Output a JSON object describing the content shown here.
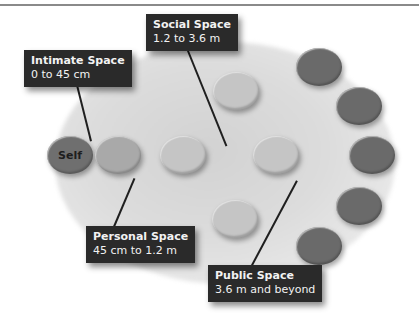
{
  "diagram": {
    "center_label": "Self",
    "zones": [
      {
        "name": "Intimate Space",
        "range": "0 to 45 cm"
      },
      {
        "name": "Personal Space",
        "range": "45 cm to 1.2 m"
      },
      {
        "name": "Social Space",
        "range": "1.2 to 3.6 m"
      },
      {
        "name": "Public Space",
        "range": "3.6 m and beyond"
      }
    ],
    "colors": {
      "self": "#6f6f6f",
      "personal": "#a9a9a9",
      "social": "#c5c5c5",
      "public": "#6a6a6a",
      "label_bg": "#2a2a2a",
      "label_text": "#f2f2f2"
    }
  }
}
